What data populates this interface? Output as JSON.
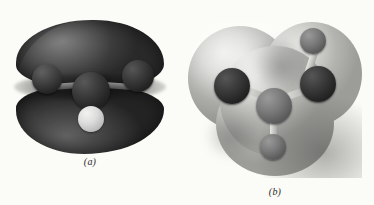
{
  "figure": {
    "kind": "molecular-visualization-pair",
    "background_color": "#fbfbf7",
    "panels": [
      {
        "id": "a",
        "caption": "(a)",
        "surface": {
          "name": "pi-molecular-orbital-surface",
          "description": "two-lobed dark isosurface above and below a nodal plane",
          "color_dark": "#2b2b2b",
          "color_highlight": "#6f6f6f"
        },
        "atoms": [
          {
            "name": "atom-left",
            "element_shade": "dark",
            "color": "#2a2a2a"
          },
          {
            "name": "atom-center",
            "element_shade": "dark",
            "color": "#242424"
          },
          {
            "name": "atom-right",
            "element_shade": "dark",
            "color": "#2a2a2a"
          },
          {
            "name": "atom-hydrogen-lower",
            "element_shade": "light",
            "color": "#dedede"
          }
        ],
        "bonds": [
          {
            "name": "bond-center-left"
          },
          {
            "name": "bond-center-right"
          },
          {
            "name": "bond-center-hydrogen"
          }
        ]
      },
      {
        "id": "b",
        "caption": "(b)",
        "surface": {
          "name": "electron-density-surface",
          "description": "light grey three-lobed van der Waals cloud",
          "color_light": "#e9e9e6",
          "color_shadow": "#9c9c99"
        },
        "atoms": [
          {
            "name": "atom-upper-left",
            "element_shade": "dark",
            "color": "#2a2a2a"
          },
          {
            "name": "atom-upper-right",
            "element_shade": "dark",
            "color": "#222222"
          },
          {
            "name": "atom-center",
            "element_shade": "mid",
            "color": "#5c5c5c"
          },
          {
            "name": "atom-hydrogen-top",
            "element_shade": "light",
            "color": "#c9c9c6"
          },
          {
            "name": "atom-hydrogen-bottom",
            "element_shade": "mid",
            "color": "#6e6e6b"
          }
        ],
        "bonds": [
          {
            "name": "bond-center-upper-left"
          },
          {
            "name": "bond-center-upper-right"
          },
          {
            "name": "bond-center-hydrogen-bottom"
          },
          {
            "name": "bond-upper-right-hydrogen-top"
          }
        ]
      }
    ]
  }
}
